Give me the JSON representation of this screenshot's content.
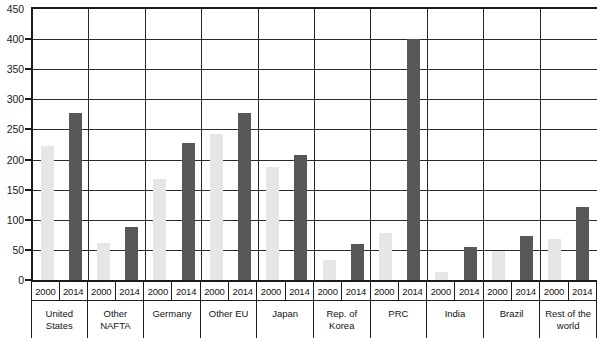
{
  "chart_data": {
    "type": "bar",
    "title": "",
    "subtitle": "",
    "xlabel": "",
    "ylabel": "",
    "ylim": [
      0,
      450
    ],
    "y_ticks": [
      0,
      50,
      100,
      150,
      200,
      250,
      300,
      350,
      400,
      450
    ],
    "grid": true,
    "legend_position": "none",
    "categories": [
      "United States",
      "Other NAFTA",
      "Germany",
      "Other EU",
      "Japan",
      "Rep. of Korea",
      "PRC",
      "India",
      "Brazil",
      "Rest of the world"
    ],
    "series": [
      {
        "name": "2000",
        "color": "#e6e6e6",
        "values": [
          222,
          62,
          168,
          242,
          188,
          33,
          78,
          14,
          48,
          68
        ]
      },
      {
        "name": "2014",
        "color": "#585858",
        "values": [
          278,
          88,
          228,
          278,
          207,
          60,
          400,
          55,
          73,
          122
        ]
      }
    ]
  },
  "axis": {
    "y_tick_labels": [
      "450",
      "400",
      "350",
      "300",
      "250",
      "200",
      "150",
      "100",
      "50",
      "0"
    ],
    "groups": [
      {
        "name": "United States",
        "name_display": "United\nStates",
        "years": [
          "2000",
          "2014"
        ]
      },
      {
        "name": "Other NAFTA",
        "name_display": "Other\nNAFTA",
        "years": [
          "2000",
          "2014"
        ]
      },
      {
        "name": "Germany",
        "name_display": "Germany",
        "years": [
          "2000",
          "2014"
        ]
      },
      {
        "name": "Other EU",
        "name_display": "Other EU",
        "years": [
          "2000",
          "2014"
        ]
      },
      {
        "name": "Japan",
        "name_display": "Japan",
        "years": [
          "2000",
          "2014"
        ]
      },
      {
        "name": "Rep. of Korea",
        "name_display": "Rep. of\nKorea",
        "years": [
          "2000",
          "2014"
        ]
      },
      {
        "name": "PRC",
        "name_display": "PRC",
        "years": [
          "2000",
          "2014"
        ]
      },
      {
        "name": "India",
        "name_display": "India",
        "years": [
          "2000",
          "2014"
        ]
      },
      {
        "name": "Brazil",
        "name_display": "Brazil",
        "years": [
          "2000",
          "2014"
        ]
      },
      {
        "name": "Rest of the world",
        "name_display": "Rest of the\nworld",
        "years": [
          "2000",
          "2014"
        ]
      }
    ]
  },
  "colors": {
    "bar_2000": "#e6e6e6",
    "bar_2014": "#585858",
    "axis": "#1c1c1c",
    "gridline": "#2b2b2b",
    "background": "#ffffff"
  }
}
